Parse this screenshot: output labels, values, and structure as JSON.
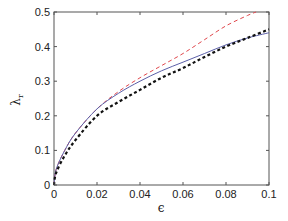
{
  "chart_data": {
    "type": "line",
    "title": "",
    "xlabel": "ϵ",
    "ylabel": "λr",
    "xlim": [
      0,
      0.1
    ],
    "ylim": [
      0,
      0.5
    ],
    "xticks": [
      0,
      0.02,
      0.04,
      0.06,
      0.08,
      0.1
    ],
    "xtick_labels": [
      "0",
      "0.02",
      "0.04",
      "0.06",
      "0.08",
      "0.1"
    ],
    "yticks": [
      0,
      0.1,
      0.2,
      0.3,
      0.4,
      0.5
    ],
    "ytick_labels": [
      "0",
      "0.1",
      "0.2",
      "0.3",
      "0.4",
      "0.5"
    ],
    "grid": false,
    "legend": null,
    "series": [
      {
        "name": "red-dashed",
        "color": "#e0474c",
        "style": "dashed",
        "x": [
          0,
          0.001,
          0.005,
          0.01,
          0.02,
          0.03,
          0.04,
          0.05,
          0.06,
          0.07,
          0.08,
          0.09,
          0.094
        ],
        "y": [
          0,
          0.045,
          0.1,
          0.15,
          0.22,
          0.27,
          0.31,
          0.345,
          0.38,
          0.42,
          0.46,
          0.49,
          0.5
        ]
      },
      {
        "name": "blue-solid",
        "color": "#5b5fa8",
        "style": "solid",
        "x": [
          0,
          0.001,
          0.005,
          0.01,
          0.02,
          0.03,
          0.04,
          0.05,
          0.06,
          0.07,
          0.08,
          0.09,
          0.1
        ],
        "y": [
          0,
          0.045,
          0.1,
          0.15,
          0.22,
          0.265,
          0.3,
          0.33,
          0.355,
          0.38,
          0.405,
          0.425,
          0.44
        ]
      },
      {
        "name": "black-dashed",
        "color": "#111111",
        "style": "dashed-bold",
        "x": [
          0,
          0.001,
          0.005,
          0.01,
          0.02,
          0.03,
          0.04,
          0.05,
          0.06,
          0.07,
          0.08,
          0.09,
          0.1
        ],
        "y": [
          0,
          0.035,
          0.085,
          0.13,
          0.2,
          0.24,
          0.275,
          0.31,
          0.338,
          0.37,
          0.4,
          0.425,
          0.45
        ]
      }
    ]
  }
}
